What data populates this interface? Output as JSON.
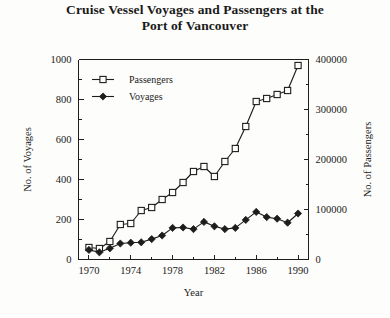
{
  "chart_data": {
    "type": "line",
    "title": "Cruise Vessel Voyages and Passengers at the Port of Vancouver",
    "title_line1": "Cruise Vessel Voyages and Passengers at the",
    "title_line2": "Port of Vancouver",
    "xlabel": "Year",
    "ylabel": "No. of Voyages",
    "ylabel_right": "No. of Passengers",
    "xlim": [
      1969,
      1991
    ],
    "ylim": [
      0,
      1000
    ],
    "ylim_right": [
      0,
      400000
    ],
    "grid": false,
    "legend_position": "upper-left-inside",
    "x_major_ticks": [
      1970,
      1974,
      1978,
      1982,
      1986,
      1990
    ],
    "x_minor_ticks": [
      1972,
      1976,
      1980,
      1984,
      1988
    ],
    "x_tick_labels": [
      "1970",
      "1974",
      "1978",
      "1982",
      "1986",
      "1990"
    ],
    "y_major_ticks": [
      0,
      200,
      400,
      600,
      800,
      1000
    ],
    "y_minor_ticks": [
      100,
      300,
      500,
      700,
      900
    ],
    "y_tick_labels": [
      "0",
      "200",
      "400",
      "600",
      "800",
      "1000"
    ],
    "y_right_major_ticks": [
      0,
      100000,
      200000,
      300000,
      400000
    ],
    "y_right_minor_ticks": [
      50000,
      150000,
      250000,
      350000
    ],
    "y_right_tick_labels": [
      "0",
      "100000",
      "200000",
      "300000",
      "400000"
    ],
    "x": [
      1970,
      1971,
      1972,
      1973,
      1974,
      1975,
      1976,
      1977,
      1978,
      1979,
      1980,
      1981,
      1982,
      1983,
      1984,
      1985,
      1986,
      1987,
      1988,
      1989,
      1990
    ],
    "series": [
      {
        "name": "Passengers",
        "axis": "right",
        "marker": "open-square",
        "values": [
          24000,
          22000,
          36000,
          70000,
          72000,
          98000,
          104000,
          120000,
          134000,
          154000,
          176000,
          186000,
          166000,
          196000,
          222000,
          266000,
          316000,
          322000,
          330000,
          338000,
          388000
        ]
      },
      {
        "name": "Voyages",
        "axis": "left",
        "marker": "filled-diamond",
        "values": [
          48,
          36,
          56,
          80,
          84,
          86,
          102,
          120,
          158,
          160,
          152,
          188,
          166,
          152,
          158,
          198,
          238,
          212,
          204,
          184,
          230
        ]
      }
    ],
    "legend": [
      "Passengers",
      "Voyages"
    ],
    "colors": {
      "line": "#1d1d1d",
      "background": "#fdfdfb",
      "marker_fill_open": "#fdfdfb",
      "marker_fill_closed": "#1d1d1d"
    }
  }
}
